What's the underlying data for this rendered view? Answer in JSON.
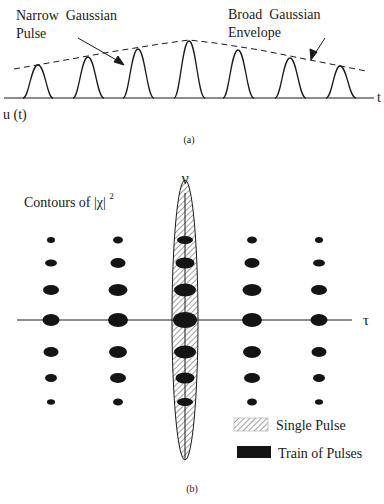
{
  "panel_a": {
    "caption": "(a)",
    "label_narrow_line1": "Narrow  Gaussian",
    "label_narrow_line2": "Pulse",
    "label_broad_line1": "Broad  Gaussian",
    "label_broad_line2": "Envelope",
    "axis_x_label": "t",
    "signal_label": "u (t)",
    "pulse_count": 7
  },
  "panel_b": {
    "caption": "(b)",
    "title_prefix": "Contours of |χ|",
    "title_superscript": "2",
    "axis_v_label": "ν",
    "axis_h_label": "τ",
    "legend": [
      {
        "label": "Single Pulse",
        "swatch": "hatched"
      },
      {
        "label": "Train of Pulses",
        "swatch": "solid"
      }
    ],
    "grid_columns": 5,
    "grid_rows": 7
  },
  "colors": {
    "ink": "#1a1a1a",
    "hatch": "#888888",
    "background": "#ffffff"
  }
}
